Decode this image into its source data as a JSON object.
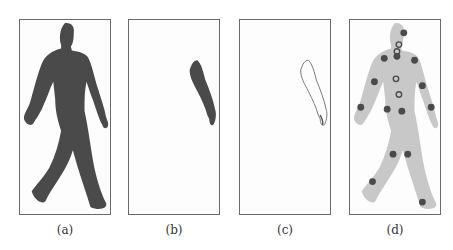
{
  "figure": {
    "panels": [
      {
        "id": "a",
        "caption": "(a)",
        "content": "dark silhouette of walking person"
      },
      {
        "id": "b",
        "caption": "(b)",
        "content": "segmented dark arm region"
      },
      {
        "id": "c",
        "caption": "(c)",
        "content": "outline contour of arm region"
      },
      {
        "id": "d",
        "caption": "(d)",
        "content": "light gray silhouette with joint markers"
      }
    ],
    "colors": {
      "silhouette_dark": "#4a4a4a",
      "silhouette_light": "#c8c8c8",
      "marker": "#4a4a4a",
      "frame": "#6a6a6a"
    }
  }
}
